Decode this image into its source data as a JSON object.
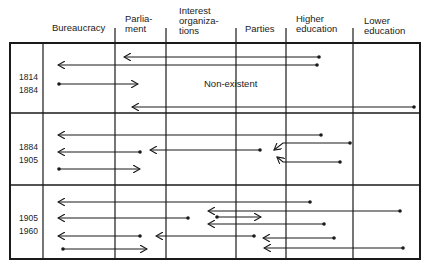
{
  "headers": [
    {
      "key": "bureaucracy",
      "label": "Bureaucracy"
    },
    {
      "key": "parliament",
      "label": "Parlia-\nment"
    },
    {
      "key": "interest_organizations",
      "label": "Interest\norganiza-\ntions"
    },
    {
      "key": "parties",
      "label": "Parties"
    },
    {
      "key": "higher_education",
      "label": "Higher\neducation"
    },
    {
      "key": "lower_education",
      "label": "Lower\neducation"
    }
  ],
  "periods": [
    {
      "label": "1814\n1884",
      "note": "Non-existent"
    },
    {
      "label": "1884\n1905",
      "note": ""
    },
    {
      "label": "1905\n1960",
      "note": ""
    }
  ],
  "colors": {
    "line": "#1a1a1a",
    "background": "#ffffff"
  },
  "arrows": [
    {
      "period": 0,
      "from": "higher_education",
      "to": "parliament",
      "x1": 319,
      "y1": 57,
      "x2": 124,
      "y2": 57
    },
    {
      "period": 0,
      "from": "higher_education",
      "to": "bureaucracy",
      "x1": 317,
      "y1": 65,
      "x2": 58,
      "y2": 65
    },
    {
      "period": 0,
      "from": "bureaucracy",
      "to": "parliament",
      "x1": 59,
      "y1": 84,
      "x2": 138,
      "y2": 84
    },
    {
      "period": 0,
      "from": "lower_education",
      "to": "parliament",
      "x1": 414,
      "y1": 107,
      "x2": 132,
      "y2": 107
    },
    {
      "period": 1,
      "from": "higher_education",
      "to": "bureaucracy",
      "x1": 321,
      "y1": 135,
      "x2": 58,
      "y2": 135
    },
    {
      "period": 1,
      "from": "parliament",
      "to": "bureaucracy",
      "x1": 140,
      "y1": 152,
      "x2": 58,
      "y2": 152
    },
    {
      "period": 1,
      "from": "parties",
      "to": "parliament",
      "x1": 260,
      "y1": 150,
      "x2": 150,
      "y2": 150
    },
    {
      "period": 1,
      "from": "bureaucracy",
      "to": "parliament",
      "x1": 59,
      "y1": 169,
      "x2": 140,
      "y2": 169
    },
    {
      "period": 2,
      "from": "higher_education",
      "to": "bureaucracy",
      "x1": 310,
      "y1": 202,
      "x2": 58,
      "y2": 202
    },
    {
      "period": 2,
      "from": "interest_organizations",
      "to": "bureaucracy",
      "x1": 188,
      "y1": 218,
      "x2": 58,
      "y2": 218
    },
    {
      "period": 2,
      "from": "lower_education",
      "to": "interest_organizations",
      "x1": 400,
      "y1": 211,
      "x2": 208,
      "y2": 211
    },
    {
      "period": 2,
      "from": "interest_organizations",
      "to": "parties",
      "x1": 217,
      "y1": 217,
      "x2": 261,
      "y2": 217
    },
    {
      "period": 2,
      "from": "higher_education",
      "to": "interest_organizations",
      "x1": 324,
      "y1": 224,
      "x2": 208,
      "y2": 224
    },
    {
      "period": 2,
      "from": "parliament",
      "to": "bureaucracy",
      "x1": 140,
      "y1": 236,
      "x2": 58,
      "y2": 236
    },
    {
      "period": 2,
      "from": "parties",
      "to": "parliament",
      "x1": 254,
      "y1": 236,
      "x2": 156,
      "y2": 236
    },
    {
      "period": 2,
      "from": "higher_education",
      "to": "parties",
      "x1": 334,
      "y1": 238,
      "x2": 263,
      "y2": 238
    },
    {
      "period": 2,
      "from": "lower_education",
      "to": "parties",
      "x1": 403,
      "y1": 248,
      "x2": 264,
      "y2": 248
    },
    {
      "period": 2,
      "from": "bureaucracy",
      "to": "parliament",
      "x1": 63,
      "y1": 249,
      "x2": 147,
      "y2": 249
    }
  ],
  "converging_arrows": [
    {
      "period": 1,
      "from": "higher_education",
      "to": "parties",
      "path": [
        [
          350,
          143
        ],
        [
          283,
          143
        ],
        [
          274,
          150
        ]
      ]
    },
    {
      "period": 1,
      "from": "higher_education",
      "to": "parties",
      "path": [
        [
          340,
          162
        ],
        [
          283,
          162
        ],
        [
          277,
          157
        ]
      ]
    }
  ]
}
